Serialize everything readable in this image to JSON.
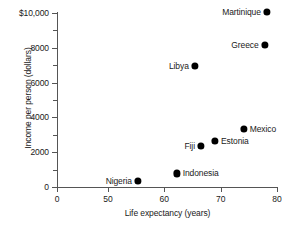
{
  "chart_data": {
    "type": "scatter",
    "title": "",
    "xlabel": "Life expectancy (years)",
    "ylabel": "Income per person (dollars)",
    "xlim": [
      46,
      80
    ],
    "ylim": [
      0,
      10000
    ],
    "grid": false,
    "legend": "none",
    "x_ticks": [
      {
        "label": "0",
        "value": 0
      },
      {
        "label": "50",
        "value": 50
      },
      {
        "label": "60",
        "value": 60
      },
      {
        "label": "70",
        "value": 70
      },
      {
        "label": "80",
        "value": 80
      }
    ],
    "y_ticks": [
      {
        "label": "0",
        "value": 0
      },
      {
        "label": "2000",
        "value": 2000
      },
      {
        "label": "4000",
        "value": 4000
      },
      {
        "label": "6000",
        "value": 6000
      },
      {
        "label": "8000",
        "value": 8000
      },
      {
        "label": "$10,000",
        "value": 10000
      }
    ],
    "y_minor_ticks": [
      1000,
      3000,
      5000,
      7000,
      9000
    ],
    "points": [
      {
        "name": "Martinique",
        "x": 78.2,
        "y": 10050,
        "label_side": "left"
      },
      {
        "name": "Greece",
        "x": 77.8,
        "y": 8150,
        "label_side": "left"
      },
      {
        "name": "Libya",
        "x": 65.4,
        "y": 6950,
        "label_side": "left"
      },
      {
        "name": "Mexico",
        "x": 74.1,
        "y": 3350,
        "label_side": "right"
      },
      {
        "name": "Estonia",
        "x": 69.0,
        "y": 2650,
        "label_side": "right"
      },
      {
        "name": "Fiji",
        "x": 66.5,
        "y": 2380,
        "label_side": "left"
      },
      {
        "name": "Indonesia",
        "x": 62.2,
        "y": 780,
        "label_side": "right"
      },
      {
        "name": "Nigeria",
        "x": 55.3,
        "y": 350,
        "label_side": "left"
      }
    ]
  }
}
